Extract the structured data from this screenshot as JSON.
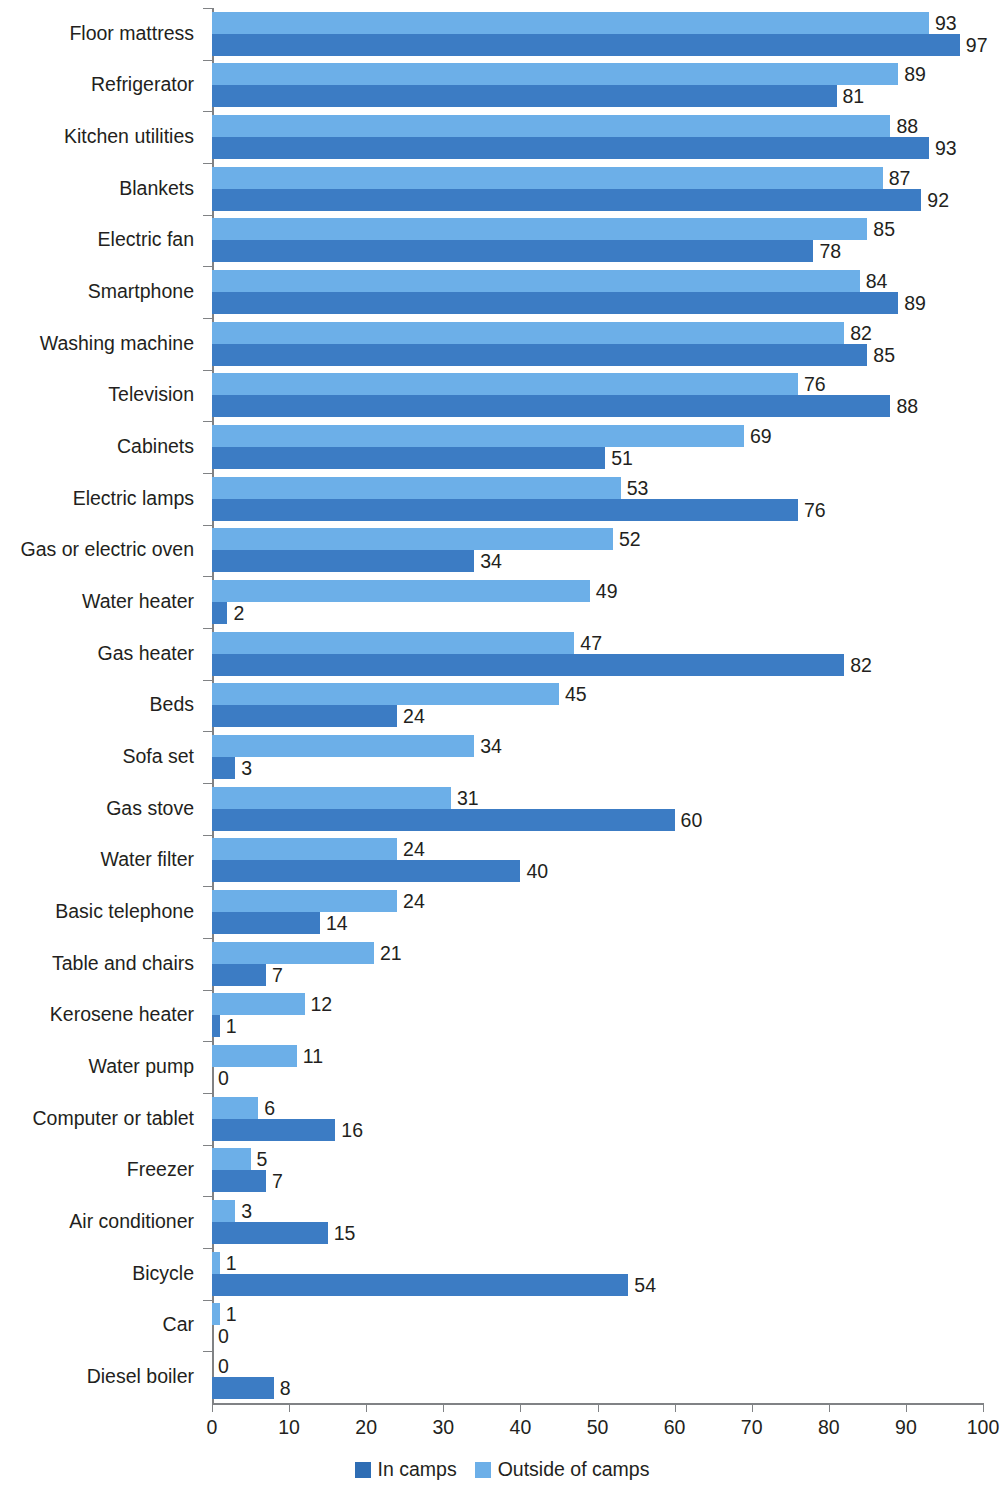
{
  "chart_data": {
    "type": "bar",
    "orientation": "horizontal",
    "title": "",
    "subtitle": "",
    "xlabel": "",
    "ylabel": "",
    "xlim": [
      0,
      100
    ],
    "xticks": [
      0,
      10,
      20,
      30,
      40,
      50,
      60,
      70,
      80,
      90,
      100
    ],
    "xtick_labels": [
      "0",
      "10",
      "20",
      "30",
      "40",
      "50",
      "60",
      "70",
      "80",
      "90",
      "100"
    ],
    "grid": false,
    "legend_position": "bottom-center",
    "categories": [
      "Floor mattress",
      "Refrigerator",
      "Kitchen utilities",
      "Blankets",
      "Electric fan",
      "Smartphone",
      "Washing machine",
      "Television",
      "Cabinets",
      "Electric lamps",
      "Gas or electric oven",
      "Water heater",
      "Gas heater",
      "Beds",
      "Sofa set",
      "Gas stove",
      "Water filter",
      "Basic telephone",
      "Table and chairs",
      "Kerosene heater",
      "Water pump",
      "Computer or tablet",
      "Freezer",
      "Air conditioner",
      "Bicycle",
      "Car",
      "Diesel boiler"
    ],
    "series": [
      {
        "name": "Outside of camps",
        "color": "#6cafe8",
        "values": [
          93,
          89,
          88,
          87,
          85,
          84,
          82,
          76,
          69,
          53,
          52,
          49,
          47,
          45,
          34,
          31,
          24,
          24,
          21,
          12,
          11,
          6,
          5,
          3,
          1,
          1,
          0
        ]
      },
      {
        "name": "In camps",
        "color": "#3c7cc4",
        "values": [
          97,
          81,
          93,
          92,
          78,
          89,
          85,
          88,
          51,
          76,
          34,
          2,
          82,
          24,
          3,
          60,
          40,
          14,
          7,
          1,
          0,
          16,
          7,
          15,
          54,
          0,
          8
        ]
      }
    ]
  },
  "legend": {
    "items": [
      {
        "label": "In camps",
        "swatch": "incamps"
      },
      {
        "label": "Outside of camps",
        "swatch": "outside"
      }
    ]
  },
  "colors": {
    "outside_of_camps": "#6cafe8",
    "in_camps": "#3c7cc4",
    "legend_in_camps": "#2e6db4",
    "axis": "#808285",
    "text": "#231f20",
    "background": "#ffffff"
  }
}
